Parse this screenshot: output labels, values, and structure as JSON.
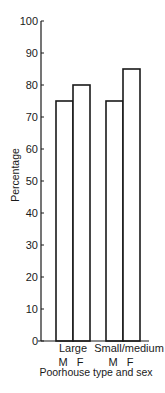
{
  "chart_data": {
    "type": "bar",
    "title": "",
    "xlabel": "Poorhouse type and sex",
    "ylabel": "Percentage",
    "ylim": [
      0,
      100
    ],
    "yticks": [
      0,
      10,
      20,
      30,
      40,
      50,
      60,
      70,
      80,
      90,
      100
    ],
    "groups": [
      "Large",
      "Small/medium"
    ],
    "categories": [
      "Large M",
      "Large F",
      "Small/medium M",
      "Small/medium F"
    ],
    "sublabels": [
      "M",
      "F",
      "M",
      "F"
    ],
    "values": [
      75,
      80,
      75,
      85
    ],
    "grid": false,
    "legend": null
  }
}
